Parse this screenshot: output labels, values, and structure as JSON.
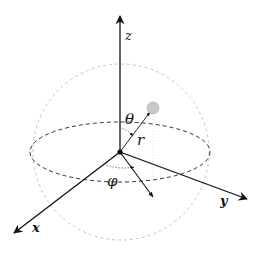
{
  "diagram": {
    "labels": {
      "z_axis": "z",
      "x_axis": "x",
      "y_axis": "y",
      "polar_angle": "θ",
      "azimuth_angle": "φ",
      "radius": "r"
    },
    "colors": {
      "axis": "#111111",
      "equator": "#333333",
      "sphere_outline": "#bbbbbb",
      "point_fill": "#c8c8c8",
      "projection": "#cccccc"
    },
    "geometry": {
      "origin": [
        120,
        152
      ],
      "sphere_center": [
        121,
        152
      ],
      "sphere_radius": 88,
      "equator_rx": 90,
      "equator_ry": 28,
      "point": [
        153,
        108
      ]
    }
  }
}
